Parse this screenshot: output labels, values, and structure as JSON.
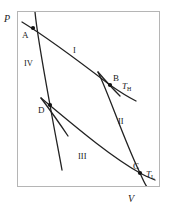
{
  "figure": {
    "type": "pv-diagram",
    "frame": {
      "x": 17,
      "y": 11,
      "width": 143,
      "height": 176,
      "border_color": "#b5b5b5"
    },
    "curve_color": "#222222",
    "marker_color": "#111111"
  },
  "axes": {
    "y_label": "P",
    "x_label": "V",
    "y_label_pos": {
      "x": 4,
      "y": 14
    },
    "x_label_pos": {
      "x": 128,
      "y": 194
    }
  },
  "points": [
    {
      "id": "A",
      "label": "A",
      "x": 33,
      "y": 28,
      "label_x": 22,
      "label_y": 31
    },
    {
      "id": "B",
      "label": "B",
      "x": 110,
      "y": 85,
      "label_x": 113,
      "label_y": 74
    },
    {
      "id": "C",
      "label": "C",
      "x": 140,
      "y": 173,
      "label_x": 133,
      "label_y": 162
    },
    {
      "id": "D",
      "label": "D",
      "x": 50,
      "y": 105,
      "label_x": 38,
      "label_y": 106
    }
  ],
  "regions": [
    {
      "label": "I",
      "x": 73,
      "y": 46,
      "process": "isothermal-expansion"
    },
    {
      "label": "II",
      "x": 118,
      "y": 117,
      "process": "adiabatic-expansion"
    },
    {
      "label": "III",
      "x": 78,
      "y": 152,
      "process": "isothermal-compression"
    },
    {
      "label": "IV",
      "x": 24,
      "y": 59,
      "process": "adiabatic-compression"
    }
  ],
  "isotherms": [
    {
      "id": "T_H",
      "base": "T",
      "sub": "H",
      "label_x": 122,
      "label_y": 82,
      "path": "M 22,22 C 45,36 80,62 110,85 C 120,92 128,97 136,101"
    },
    {
      "id": "T_L",
      "base": "T",
      "sub": "L",
      "label_x": 146,
      "label_y": 170,
      "path": "M 41,98 C 70,122 108,155 140,173 C 145,176 150,178 155,180"
    }
  ],
  "adiabats": [
    {
      "id": "A-D",
      "path": "M 35,12 C 37,34 44,72 50,105 C 54,128 58,148 62,170"
    },
    {
      "id": "B-C",
      "path": "M 98,72 C 108,92 124,140 140,173 C 143,180 145,184 147,187"
    }
  ],
  "tails": [
    {
      "id": "D-tail",
      "path": "M 41,98 C 50,110 60,124 68,136"
    },
    {
      "id": "B-tail",
      "path": "M 98,72 C 104,79 112,88 120,96"
    }
  ]
}
